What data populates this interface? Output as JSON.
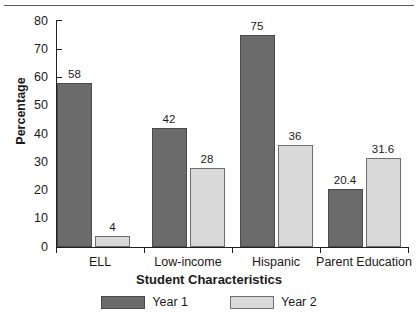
{
  "chart_data": {
    "type": "bar",
    "title": "",
    "subtitle": "",
    "xlabel": "Student Characteristics",
    "ylabel": "Percentage",
    "categories": [
      "ELL",
      "Low-income",
      "Hispanic",
      "Parent Education"
    ],
    "series": [
      {
        "name": "Year 1",
        "values": [
          58,
          42,
          75,
          20.4
        ],
        "color": "#6b6b6b"
      },
      {
        "name": "Year 2",
        "values": [
          4,
          28,
          36,
          31.6
        ],
        "color": "#d9d9d9"
      }
    ],
    "value_labels": [
      [
        "58",
        "42",
        "75",
        "20.4"
      ],
      [
        "4",
        "28",
        "36",
        "31.6"
      ]
    ],
    "ylim": [
      0,
      80
    ],
    "yticks": [
      0,
      10,
      20,
      30,
      40,
      50,
      60,
      70,
      80
    ],
    "ytick_labels": [
      "0",
      "10",
      "20",
      "30",
      "40",
      "50",
      "60",
      "70",
      "80"
    ],
    "grid": false,
    "legend_position": "bottom-center",
    "legend_entries": [
      "Year 1",
      "Year 2"
    ],
    "bar_style": "grouped"
  },
  "axes": {
    "y_title": "Percentage",
    "x_title": "Student Characteristics"
  },
  "legend": {
    "items": [
      {
        "label": "Year 1"
      },
      {
        "label": "Year 2"
      }
    ]
  }
}
